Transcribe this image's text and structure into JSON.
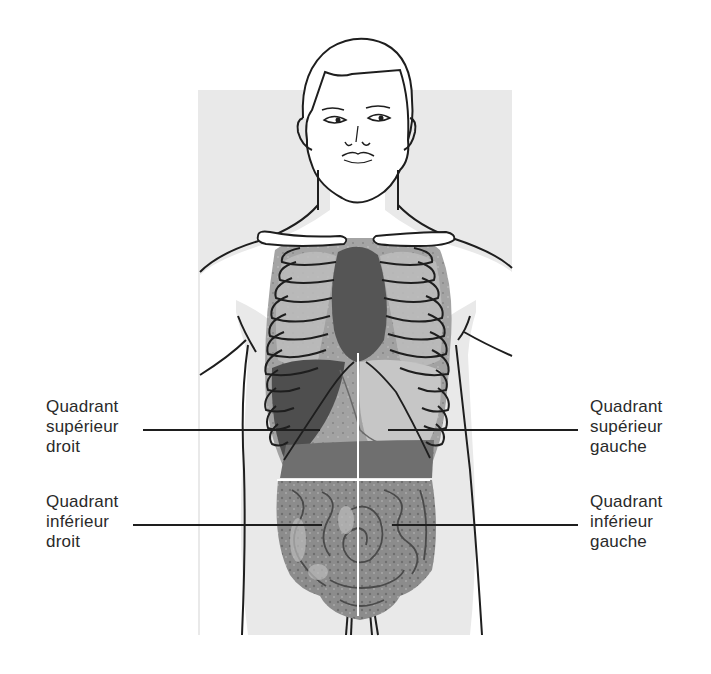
{
  "diagram": {
    "colors": {
      "background": "#ffffff",
      "panel_gray": "#e9e9e9",
      "outline": "#1e1e1e",
      "organ_dark": "#5a5a5a",
      "organ_mid": "#8a8a8a",
      "organ_light": "#b8b8b8",
      "divider": "#ffffff",
      "text": "#2a2a2a"
    },
    "labels": {
      "right_upper": {
        "line1": "Quadrant",
        "line2": "supérieur",
        "line3": "droit"
      },
      "right_lower": {
        "line1": "Quadrant",
        "line2": "inférieur",
        "line3": "droit"
      },
      "left_upper": {
        "line1": "Quadrant",
        "line2": "supérieur",
        "line3": "gauche"
      },
      "left_lower": {
        "line1": "Quadrant",
        "line2": "inférieur",
        "line3": "gauche"
      }
    }
  }
}
